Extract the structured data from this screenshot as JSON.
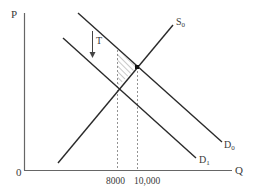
{
  "diagram": {
    "type": "supply-demand-tax",
    "axes": {
      "y_label": "P",
      "x_label": "Q",
      "origin_label": "0"
    },
    "curves": [
      {
        "id": "S0",
        "name": "S",
        "subscript": "0",
        "kind": "supply"
      },
      {
        "id": "D0",
        "name": "D",
        "subscript": "0",
        "kind": "demand"
      },
      {
        "id": "D1",
        "name": "D",
        "subscript": "1",
        "kind": "demand"
      }
    ],
    "tax_label": "T",
    "x_ticks": [
      {
        "value": "8000",
        "label": "8000"
      },
      {
        "value": "10000",
        "label": "10,000"
      }
    ],
    "annotations": {
      "equilibrium_point": "D0 ∩ S0 at Q=10,000",
      "hatched_region": "triangle between D0, S0 and Q=8000"
    },
    "colors": {
      "line": "#2a2a2a",
      "axis": "#555555",
      "dashed": "#777777",
      "hatch": "#888888"
    }
  }
}
